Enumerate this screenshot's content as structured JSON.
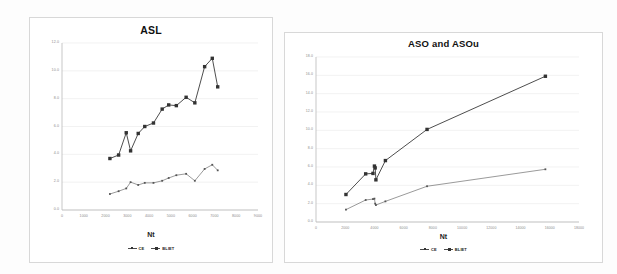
{
  "document": {
    "background": "#fdfdfd",
    "figure_count": 2
  },
  "colors": {
    "series_primary": "#3a3a3a",
    "series_secondary": "#6e6e6e",
    "gridline": "#ededed",
    "axis": "#b9b9b9",
    "tick_text": "#8b8b8b",
    "title_text": "#111111"
  },
  "legend_shared": {
    "entries": [
      {
        "label": "CE",
        "marker": "diamond-small"
      },
      {
        "label": "BLIET",
        "marker": "square"
      }
    ]
  },
  "chart_data": [
    {
      "id": "asl",
      "type": "line",
      "title": "ASL",
      "xlabel": "Nt",
      "ylabel": "",
      "xlim": [
        0,
        9000
      ],
      "ylim": [
        0,
        12
      ],
      "grid": true,
      "legend_position": "bottom",
      "xticks": [
        0,
        1000,
        2000,
        3000,
        4000,
        5000,
        6000,
        7000,
        8000,
        9000
      ],
      "xticklabels": [
        "0",
        "1000",
        "2000",
        "3000",
        "4000",
        "5000",
        "6000",
        "7000",
        "8000",
        "9000"
      ],
      "yticks": [
        0,
        2,
        4,
        6,
        8,
        10,
        12
      ],
      "yticklabels": [
        "0.0",
        "2.0",
        "4.0",
        "6.0",
        "8.0",
        "10.0",
        "12.0"
      ],
      "series": [
        {
          "name": "BLIET",
          "marker": "square",
          "x": [
            2200,
            2600,
            2950,
            3150,
            3500,
            3800,
            4200,
            4600,
            4900,
            5250,
            5700,
            6100,
            6550,
            6900,
            7150
          ],
          "y": [
            3.7,
            3.95,
            5.55,
            4.25,
            5.5,
            6.0,
            6.25,
            7.25,
            7.55,
            7.5,
            8.1,
            7.7,
            10.3,
            10.9,
            8.85
          ]
        },
        {
          "name": "CE",
          "marker": "diamond-small",
          "x": [
            2200,
            2600,
            2950,
            3150,
            3500,
            3800,
            4200,
            4600,
            4900,
            5250,
            5700,
            6100,
            6550,
            6900,
            7150
          ],
          "y": [
            1.15,
            1.35,
            1.55,
            2.0,
            1.8,
            1.95,
            1.95,
            2.1,
            2.3,
            2.5,
            2.6,
            2.1,
            2.95,
            3.25,
            2.85
          ]
        }
      ]
    },
    {
      "id": "aso_and_asou",
      "type": "line",
      "title": "ASO and ASOu",
      "xlabel": "Nt",
      "ylabel": "",
      "xlim": [
        0,
        18000
      ],
      "ylim": [
        0,
        18
      ],
      "grid": true,
      "legend_position": "bottom",
      "xticks": [
        0,
        2000,
        4000,
        6000,
        8000,
        10000,
        12000,
        14000,
        16000,
        18000
      ],
      "xticklabels": [
        "0",
        "2000",
        "4000",
        "6000",
        "8000",
        "10000",
        "12000",
        "14000",
        "16000",
        "18000"
      ],
      "yticks": [
        0,
        2,
        4,
        6,
        8,
        10,
        12,
        14,
        16,
        18
      ],
      "yticklabels": [
        "0.0",
        "2.0",
        "4.0",
        "6.0",
        "8.0",
        "10.0",
        "12.0",
        "14.0",
        "16.0",
        "18.0"
      ],
      "series": [
        {
          "name": "BLIET",
          "marker": "square",
          "x": [
            2050,
            3400,
            3900,
            4000,
            4050,
            4100,
            4750,
            7600,
            15700
          ],
          "y": [
            3.0,
            5.25,
            5.3,
            6.1,
            5.9,
            4.6,
            6.7,
            10.1,
            15.9
          ]
        },
        {
          "name": "CE",
          "marker": "diamond-small",
          "x": [
            2050,
            3400,
            3900,
            4000,
            4050,
            4100,
            4750,
            7600,
            15700
          ],
          "y": [
            1.35,
            2.4,
            2.5,
            2.55,
            2.0,
            1.85,
            2.25,
            3.9,
            5.75
          ]
        }
      ]
    }
  ]
}
